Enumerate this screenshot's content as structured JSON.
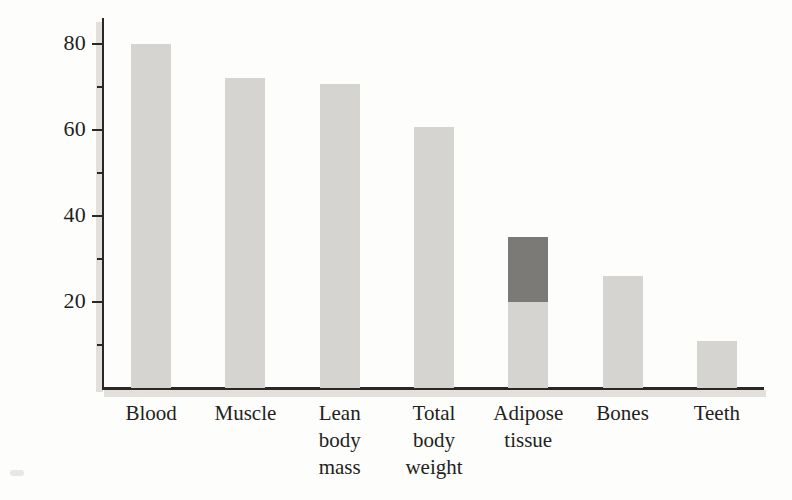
{
  "chart_data": {
    "type": "bar",
    "title": "",
    "subtitle": "",
    "xlabel": "",
    "ylabel": "Percent of water",
    "ylim": [
      0,
      85
    ],
    "yticks": [
      20,
      40,
      60,
      80
    ],
    "ytick_labels": [
      "20",
      "40",
      "60",
      "80"
    ],
    "grid": false,
    "legend": "none",
    "categories": [
      "Blood",
      "Muscle",
      "Lean body mass",
      "Total body weight",
      "Adipose tissue",
      "Bones",
      "Teeth"
    ],
    "category_label_lines": [
      [
        "Blood"
      ],
      [
        "Muscle"
      ],
      [
        "Lean",
        "body",
        "mass"
      ],
      [
        "Total",
        "body",
        "weight"
      ],
      [
        "Adipose",
        "tissue"
      ],
      [
        "Bones"
      ],
      [
        "Teeth"
      ]
    ],
    "values": [
      80,
      72,
      70.5,
      60.5,
      35,
      26,
      11
    ],
    "bars": [
      {
        "category": "Blood",
        "value": 80,
        "low": 0,
        "high": 80,
        "shaded_range": false
      },
      {
        "category": "Muscle",
        "value": 72,
        "low": 0,
        "high": 72,
        "shaded_range": false
      },
      {
        "category": "Lean body mass",
        "value": 70.5,
        "low": 0,
        "high": 70.5,
        "shaded_range": false
      },
      {
        "category": "Total body weight",
        "value": 60.5,
        "low": 0,
        "high": 60.5,
        "shaded_range": false
      },
      {
        "category": "Adipose tissue",
        "value": 35,
        "low": 20,
        "high": 35,
        "shaded_range": true
      },
      {
        "category": "Bones",
        "value": 26,
        "low": 0,
        "high": 26,
        "shaded_range": false
      },
      {
        "category": "Teeth",
        "value": 11,
        "low": 0,
        "high": 11,
        "shaded_range": false
      }
    ],
    "colors": {
      "bar_light": "#d5d4d0",
      "bar_dark": "#7b7a77",
      "axis": "#2a2724",
      "text": "#231f1d",
      "background": "#fdfdfb"
    }
  }
}
